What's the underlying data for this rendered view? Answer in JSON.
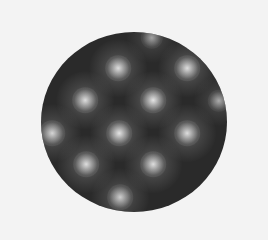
{
  "image": {
    "description": "Grayscale circular aperture showing a periodic lattice of bright spots on a dark background",
    "background_color": "#f3f3f3",
    "disk": {
      "cx": 134,
      "cy": 122,
      "rx": 93,
      "ry": 90,
      "base_color": "#2a2a2a",
      "halo_color": "#5a5a5a",
      "spot_color": "#e6e6e6"
    },
    "spots": [
      {
        "x": 152,
        "y": 38,
        "r": 7,
        "intensity": 0.55
      },
      {
        "x": 118,
        "y": 68,
        "r": 8,
        "intensity": 0.9
      },
      {
        "x": 187,
        "y": 68,
        "r": 8,
        "intensity": 0.9
      },
      {
        "x": 85,
        "y": 100,
        "r": 8,
        "intensity": 0.9
      },
      {
        "x": 153,
        "y": 100,
        "r": 8,
        "intensity": 0.95
      },
      {
        "x": 219,
        "y": 101,
        "r": 7,
        "intensity": 0.6
      },
      {
        "x": 52,
        "y": 133,
        "r": 8,
        "intensity": 0.85
      },
      {
        "x": 119,
        "y": 133,
        "r": 8,
        "intensity": 0.95
      },
      {
        "x": 187,
        "y": 133,
        "r": 8,
        "intensity": 0.9
      },
      {
        "x": 86,
        "y": 164,
        "r": 8,
        "intensity": 0.9
      },
      {
        "x": 153,
        "y": 164,
        "r": 8,
        "intensity": 0.9
      },
      {
        "x": 120,
        "y": 197,
        "r": 8,
        "intensity": 0.8
      }
    ]
  }
}
